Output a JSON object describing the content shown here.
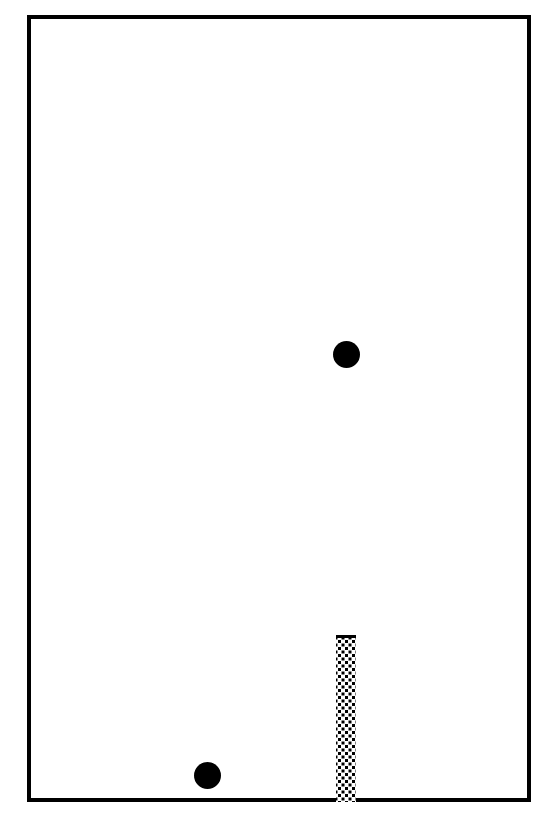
{
  "device": {
    "title": "Anesthesia machine dual flowmeter",
    "frame_color": "#000000",
    "background_color": "#ffffff"
  },
  "flowmeters": [
    {
      "id": "n2o",
      "side": "left",
      "gas_label_line1_prefix": "N",
      "gas_label_line1_sub": "2",
      "gas_label_line1_suffix": "O",
      "gas_label_line2": "L/M",
      "scale": {
        "min": 0,
        "max": 10,
        "major_step": 1,
        "minor_step": 0.5,
        "unit": "L/M",
        "major_labels": [
          "10",
          "9",
          "8",
          "7",
          "6",
          "5",
          "4",
          "3",
          "2",
          "1",
          "0"
        ],
        "major_values": [
          10,
          9,
          8,
          7,
          6,
          5,
          4,
          3,
          2,
          1,
          0
        ],
        "minor_values": [
          9.5,
          8.5,
          7.5,
          6.5,
          5.5,
          4.5,
          3.5,
          2.5,
          1.5,
          0.5
        ]
      },
      "float_ball": {
        "present": true,
        "reading": 0,
        "color": "#000000"
      },
      "flow_column": {
        "present": false,
        "top_value": 0
      }
    },
    {
      "id": "o2",
      "side": "right",
      "gas_label_line1_prefix": "O",
      "gas_label_line1_sub": "2",
      "gas_label_line1_suffix": "",
      "gas_label_line2": "L/M",
      "scale": {
        "min": 0,
        "max": 10,
        "major_step": 1,
        "minor_step": 0.5,
        "unit": "L/M",
        "major_labels": [
          "10",
          "9",
          "8",
          "7",
          "6",
          "5",
          "4",
          "3",
          "2",
          "1",
          "0"
        ],
        "major_values": [
          10,
          9,
          8,
          7,
          6,
          5,
          4,
          3,
          2,
          1,
          0
        ],
        "minor_values": [
          9.5,
          8.5,
          7.5,
          6.5,
          5.5,
          4.5,
          3.5,
          2.5,
          1.5,
          0.5
        ]
      },
      "float_ball": {
        "present": true,
        "reading": 7.5,
        "color": "#000000"
      },
      "flow_column": {
        "present": true,
        "top_value": 2.5,
        "bottom_value": 0,
        "fill_style": "stippled"
      }
    }
  ]
}
